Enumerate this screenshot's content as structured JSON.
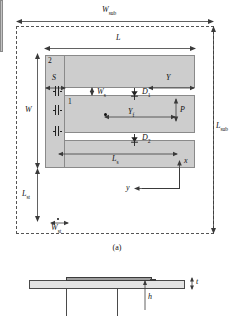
{
  "figure": {
    "caption_a": "(a)",
    "domain_note": "microstrip patch antenna geometry"
  },
  "top_view": {
    "labels": {
      "w_sub": "W",
      "w_sub_sub": "sub",
      "l_sub": "L",
      "l_sub_sub": "sub",
      "l": "L",
      "w": "W",
      "s": "S",
      "y": "Y",
      "ws": "W",
      "ws_sub": "s",
      "yf": "Y",
      "yf_sub": "f",
      "p": "P",
      "ls": "L",
      "ls_sub": "s",
      "lst": "L",
      "lst_sub": "st",
      "wst": "W",
      "wst_sub": "st",
      "d1": "D",
      "d1_sub": "1",
      "d2": "D",
      "d2_sub": "2",
      "region_1": "1",
      "region_2": "2",
      "axis_x": "x",
      "axis_y": "y"
    },
    "components": {
      "capacitor_count": 3,
      "diode_count": 2,
      "diode_names": [
        "D1",
        "D2"
      ],
      "feed_point": "probe feed"
    }
  },
  "side_view": {
    "labels": {
      "t": "t",
      "h": "h"
    }
  },
  "colors": {
    "metal_fill": "#cdcdcd",
    "substrate_edge": "#555555",
    "line": "#3a3a3a",
    "slab_fill": "#e3e3e3",
    "top_metal_fill": "#9e9e9e"
  }
}
